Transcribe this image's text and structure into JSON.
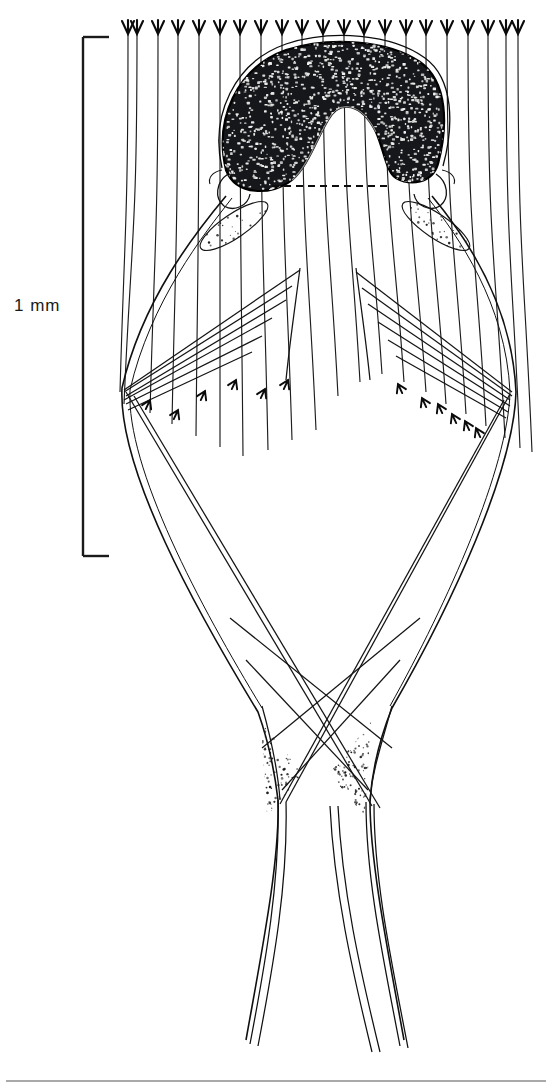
{
  "figure": {
    "domain": "Natural-Image",
    "kind": "scientific-line-drawing",
    "background_color": "#ffffff",
    "ink_color": "#111111",
    "stipple_dark_color": "#15161a",
    "stipple_light_color": "#2a2a2a",
    "canvas": {
      "width": 552,
      "height": 1090
    }
  },
  "scale_bar": {
    "label": "1 mm",
    "orientation": "vertical",
    "x": 83,
    "y_top": 37,
    "y_bottom": 556,
    "tick_length": 26,
    "stroke_width": 2.4,
    "label_x": 14,
    "label_y": 296
  },
  "top_setae": {
    "description": "row of vertical setae lines with downward trident arrowheads at top margin",
    "count": 21,
    "y_top": 21,
    "arrow_half_width": 6,
    "arrow_height": 13,
    "x_positions": [
      128,
      137,
      158,
      178,
      199,
      220,
      240,
      261,
      282,
      302,
      323,
      344,
      364,
      385,
      406,
      426,
      447,
      468,
      488,
      506,
      518
    ],
    "x_bottom": [
      120,
      124,
      150,
      172,
      196,
      220,
      243,
      268,
      292,
      316,
      338,
      360,
      382,
      404,
      426,
      446,
      466,
      486,
      505,
      520,
      532
    ],
    "y_bottom": [
      392,
      404,
      413,
      424,
      436,
      447,
      456,
      450,
      440,
      430,
      396,
      382,
      374,
      382,
      392,
      404,
      414,
      426,
      438,
      448,
      452
    ]
  },
  "inner_setae": {
    "description": "converging setae with arrowheads aimed inward at mid-wing level",
    "left_arrow_points": [
      [
        150,
        400
      ],
      [
        178,
        410
      ],
      [
        205,
        391
      ],
      [
        236,
        380
      ],
      [
        265,
        389
      ],
      [
        288,
        380
      ]
    ],
    "right_arrow_points": [
      [
        398,
        384
      ],
      [
        422,
        398
      ],
      [
        438,
        404
      ],
      [
        452,
        414
      ],
      [
        465,
        421
      ],
      [
        476,
        428
      ]
    ]
  },
  "dark_mass": {
    "name": "stippled crescent capsule",
    "fill": "#16171b",
    "outline_stroke": "#000000",
    "center_x": 330,
    "top_y": 44,
    "bottom_y": 182,
    "left_x": 222,
    "right_x": 440,
    "stipple_dot_count": 1500
  },
  "dashed_line": {
    "x1": 272,
    "x2": 392,
    "y": 186,
    "dash": "7 5",
    "stroke_width": 2.0
  },
  "stipple_patches": [
    {
      "name": "left-upper-band",
      "cx": 234,
      "cy": 226,
      "rx": 40,
      "ry": 12,
      "rot": -34,
      "dots": 150
    },
    {
      "name": "right-upper-band",
      "cx": 436,
      "cy": 226,
      "rx": 40,
      "ry": 12,
      "rot": 34,
      "dots": 150
    },
    {
      "name": "left-lower-wedge",
      "cx": 281,
      "cy": 768,
      "rx": 26,
      "ry": 44,
      "rot": 0,
      "dots": 420
    },
    {
      "name": "right-lower-wedge",
      "cx": 351,
      "cy": 768,
      "rx": 26,
      "ry": 44,
      "rot": 0,
      "dots": 420
    }
  ],
  "outline": {
    "left_wing_outer": "M226,196 C196,232 142,300 122,388 C118,470 196,610 258,712 C268,740 274,766 278,800 C280,860 262,950 246,1040",
    "right_wing_outer": "M432,196 C462,232 512,302 516,392 C514,470 452,604 392,708 C380,738 372,768 370,802 C370,862 388,952 404,1040",
    "left_inner": "M232,198 C204,234 150,302 130,390 C126,468 200,606 262,708",
    "right_inner": "M428,198 C458,236 506,304 510,392 C508,468 448,602 390,706"
  },
  "bottom_rule": {
    "y": 1081,
    "x1": 6,
    "x2": 546,
    "stroke_width": 1.6,
    "color": "#8c8c8c"
  }
}
